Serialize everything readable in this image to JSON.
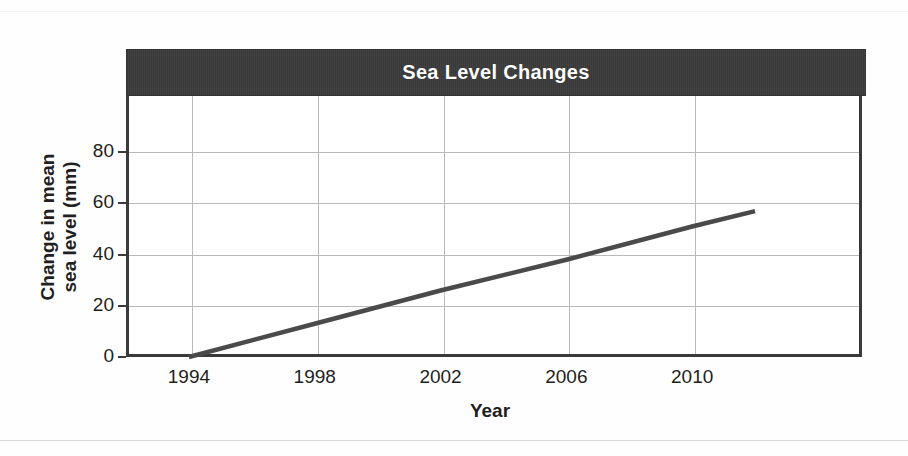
{
  "chart_data": {
    "type": "line",
    "title": "Sea Level Changes",
    "xlabel": "Year",
    "ylabel": "Change in mean sea level (mm)",
    "ylabel_line1": "Change in mean",
    "ylabel_line2": "sea level (mm)",
    "x": [
      1994,
      2012
    ],
    "y": [
      0,
      57
    ],
    "series": [
      {
        "name": "Change in mean sea level",
        "points": [
          {
            "x": 1994,
            "y": 0
          },
          {
            "x": 1998,
            "y": 13
          },
          {
            "x": 2002,
            "y": 26
          },
          {
            "x": 2006,
            "y": 38
          },
          {
            "x": 2010,
            "y": 51
          },
          {
            "x": 2012,
            "y": 57
          }
        ]
      }
    ],
    "xlim": [
      1992,
      2015.4
    ],
    "ylim": [
      0,
      102
    ],
    "xticks": [
      "1994",
      "1998",
      "2002",
      "2006",
      "2010"
    ],
    "xtick_values": [
      1994,
      1998,
      2002,
      2006,
      2010
    ],
    "yticks": [
      "0",
      "20",
      "40",
      "60",
      "80"
    ],
    "ytick_values": [
      0,
      20,
      40,
      60,
      80
    ],
    "grid": "both",
    "legend": "none",
    "colors": {
      "title_banner": "#3b3b3b",
      "title_text": "#ffffff",
      "line": "#4a4a4a",
      "axis": "#3a3a3a",
      "gridline": "#b9b9bb",
      "background": "#ffffff"
    }
  }
}
